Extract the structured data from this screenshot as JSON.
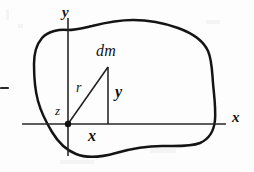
{
  "figure": {
    "caption": "",
    "ink_color": "#131313",
    "background_color": "#fdfdfd",
    "axes": {
      "y_axis_label": "y",
      "x_axis_label": "x",
      "origin_label": "z",
      "origin": {
        "x": 68,
        "y": 124
      },
      "x_axis_extent": {
        "start_x": 22,
        "end_x": 226
      },
      "y_axis_extent": {
        "start_y": 18,
        "end_y": 156
      }
    },
    "mass_element": {
      "label": "dm",
      "position": {
        "x": 108,
        "y": 67
      }
    },
    "radius": {
      "label": "r",
      "from": {
        "x": 68,
        "y": 124
      },
      "to": {
        "x": 108,
        "y": 67
      }
    },
    "vertical_leg": {
      "label": "y",
      "from": {
        "x": 108,
        "y": 67
      },
      "to": {
        "x": 108,
        "y": 124
      }
    },
    "horizontal_leg": {
      "label": "x",
      "from": {
        "x": 68,
        "y": 124
      },
      "to": {
        "x": 108,
        "y": 124
      }
    },
    "margin_tick": {
      "name": "page-margin-dash",
      "x": 1,
      "y": 87,
      "width": 7,
      "height": 2
    }
  }
}
